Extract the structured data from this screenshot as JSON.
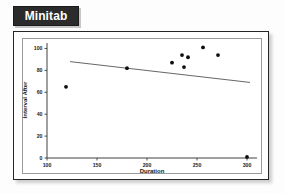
{
  "badge": {
    "title": "Minitab"
  },
  "chart_data": {
    "type": "scatter",
    "title": "",
    "xlabel": "Duration",
    "ylabel": "Interval After",
    "xlim": [
      100,
      310
    ],
    "ylim": [
      0,
      105
    ],
    "xticks": [
      100,
      150,
      200,
      250,
      300
    ],
    "yticks": [
      0,
      20,
      40,
      60,
      80,
      100
    ],
    "grid": false,
    "legend": null,
    "series": [
      {
        "name": "Interval After vs Duration",
        "marker": "filled-circle",
        "color": "#0d0d0d",
        "points": [
          {
            "x": 119,
            "y": 65
          },
          {
            "x": 180,
            "y": 82
          },
          {
            "x": 225,
            "y": 87
          },
          {
            "x": 235,
            "y": 94
          },
          {
            "x": 237,
            "y": 83
          },
          {
            "x": 241,
            "y": 92
          },
          {
            "x": 256,
            "y": 101
          },
          {
            "x": 271,
            "y": 94
          },
          {
            "x": 300,
            "y": 1
          }
        ]
      }
    ],
    "fit_line": {
      "name": "regression-line",
      "color": "#4a4a4a",
      "x_start": 123,
      "y_start": 88,
      "x_end": 303,
      "y_end": 69
    }
  }
}
